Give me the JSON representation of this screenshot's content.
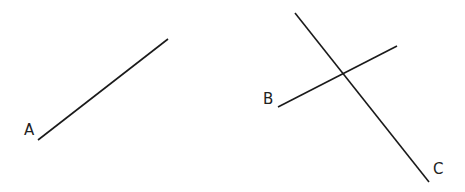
{
  "diagram": {
    "background": "#ffffff",
    "line_color": "#1a1a1a",
    "lines": [
      {
        "name": "A",
        "label": "A",
        "x1": 38,
        "y1": 140,
        "x2": 168,
        "y2": 39,
        "label_x": 24,
        "label_y": 135
      },
      {
        "name": "B",
        "label": "B",
        "x1": 278,
        "y1": 107,
        "x2": 397,
        "y2": 46,
        "label_x": 263,
        "label_y": 104
      },
      {
        "name": "C",
        "label": "C",
        "x1": 295,
        "y1": 13,
        "x2": 429,
        "y2": 182,
        "label_x": 433,
        "label_y": 174
      }
    ]
  }
}
